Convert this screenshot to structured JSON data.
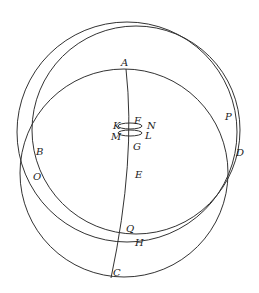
{
  "diagram": {
    "type": "geometric-circles",
    "labels": {
      "A": "A",
      "B": "B",
      "C": "C",
      "D": "D",
      "E": "E",
      "F": "F",
      "G": "G",
      "H": "H",
      "K": "K",
      "L": "L",
      "M": "M",
      "N": "N",
      "O": "O",
      "P": "P",
      "Q": "Q"
    },
    "colors": {
      "stroke": "#333333",
      "background": "#ffffff"
    }
  }
}
